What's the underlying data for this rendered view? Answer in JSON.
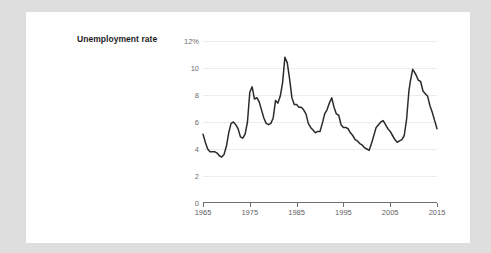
{
  "chart_data": {
    "type": "line",
    "title": "Unemployment rate",
    "xlabel": "",
    "ylabel": "",
    "unit_label": "12%",
    "grid": true,
    "legend": "none",
    "xlim": [
      1965,
      2015
    ],
    "ylim": [
      0,
      12
    ],
    "x_ticks": [
      "1965",
      "1975",
      "1985",
      "1995",
      "2005",
      "2015"
    ],
    "x_tick_values": [
      1965,
      1975,
      1985,
      1995,
      2005,
      2015
    ],
    "y_ticks": [
      "0",
      "2",
      "4",
      "6",
      "8",
      "10",
      "12%"
    ],
    "y_tick_values": [
      0,
      2,
      4,
      6,
      8,
      10,
      12
    ],
    "line_color": "#2b2b2d",
    "grid_color": "#ececed",
    "axis_color": "#6f6f72",
    "series": [
      {
        "name": "Unemployment rate",
        "x": [
          1965.0,
          1965.5,
          1966.0,
          1966.5,
          1967.0,
          1967.5,
          1968.0,
          1968.5,
          1969.0,
          1969.5,
          1970.0,
          1970.5,
          1971.0,
          1971.5,
          1972.0,
          1972.5,
          1973.0,
          1973.5,
          1974.0,
          1974.5,
          1975.0,
          1975.5,
          1976.0,
          1976.5,
          1977.0,
          1977.5,
          1978.0,
          1978.5,
          1979.0,
          1979.5,
          1980.0,
          1980.5,
          1981.0,
          1981.5,
          1982.0,
          1982.5,
          1983.0,
          1983.5,
          1984.0,
          1984.5,
          1985.0,
          1985.5,
          1986.0,
          1986.5,
          1987.0,
          1987.5,
          1988.0,
          1988.5,
          1989.0,
          1989.5,
          1990.0,
          1990.5,
          1991.0,
          1991.5,
          1992.0,
          1992.5,
          1993.0,
          1993.5,
          1994.0,
          1994.5,
          1995.0,
          1995.5,
          1996.0,
          1996.5,
          1997.0,
          1997.5,
          1998.0,
          1998.5,
          1999.0,
          1999.5,
          2000.0,
          2000.5,
          2001.0,
          2001.5,
          2002.0,
          2002.5,
          2003.0,
          2003.5,
          2004.0,
          2004.5,
          2005.0,
          2005.5,
          2006.0,
          2006.5,
          2007.0,
          2007.5,
          2008.0,
          2008.5,
          2009.0,
          2009.3,
          2009.8,
          2010.0,
          2010.5,
          2011.0,
          2011.5,
          2012.0,
          2012.5,
          2013.0,
          2013.5,
          2014.0,
          2014.5,
          2015.0
        ],
        "values": [
          5.1,
          4.5,
          4.0,
          3.8,
          3.8,
          3.8,
          3.7,
          3.5,
          3.4,
          3.6,
          4.2,
          5.2,
          5.9,
          6.0,
          5.8,
          5.5,
          4.9,
          4.8,
          5.1,
          6.0,
          8.2,
          8.6,
          7.7,
          7.8,
          7.5,
          6.9,
          6.3,
          5.9,
          5.8,
          5.9,
          6.3,
          7.6,
          7.4,
          7.9,
          8.9,
          10.8,
          10.4,
          9.2,
          7.8,
          7.3,
          7.3,
          7.1,
          7.1,
          6.9,
          6.6,
          5.9,
          5.6,
          5.4,
          5.2,
          5.3,
          5.3,
          5.9,
          6.6,
          6.9,
          7.4,
          7.8,
          7.1,
          6.6,
          6.5,
          5.8,
          5.6,
          5.6,
          5.5,
          5.2,
          5.0,
          4.7,
          4.6,
          4.4,
          4.3,
          4.1,
          4.0,
          3.9,
          4.4,
          5.0,
          5.6,
          5.8,
          6.0,
          6.1,
          5.8,
          5.5,
          5.3,
          5.0,
          4.7,
          4.5,
          4.6,
          4.7,
          5.0,
          6.2,
          8.3,
          9.0,
          9.9,
          9.8,
          9.5,
          9.1,
          9.0,
          8.3,
          8.1,
          7.9,
          7.2,
          6.7,
          6.1,
          5.5
        ]
      }
    ]
  }
}
